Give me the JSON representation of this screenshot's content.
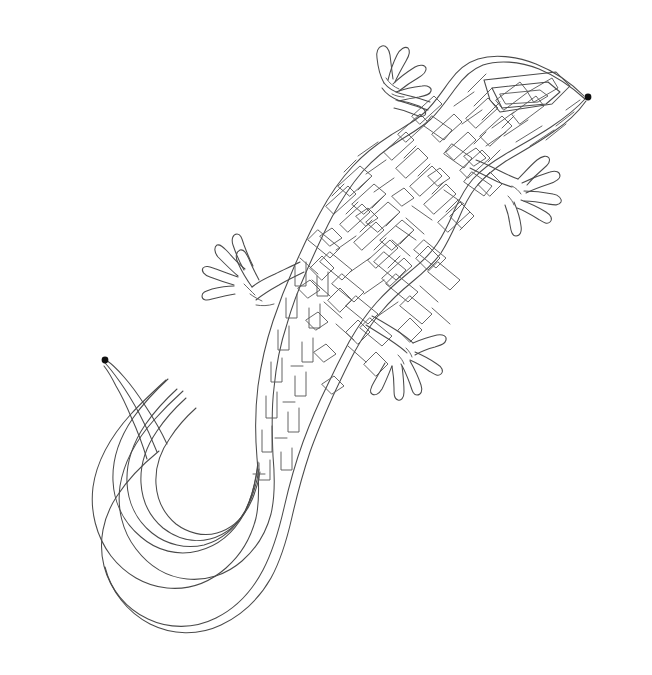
{
  "document": {
    "type": "maze-puzzle",
    "subject": "lizard",
    "title": "Lizard Maze",
    "background_color": "#ffffff",
    "line_color": "#4a4a4a",
    "marker_color": "#111111",
    "line_width": 1.05,
    "width": 652,
    "height": 675
  },
  "markers": [
    {
      "name": "start-marker",
      "label": "start",
      "x": 588,
      "y": 97,
      "radius": 3.4,
      "location": "snout tip"
    },
    {
      "name": "end-marker",
      "label": "end",
      "x": 105,
      "y": 360,
      "radius": 3.4,
      "location": "tail tip"
    }
  ],
  "body_parts": [
    {
      "name": "head",
      "label": "Head",
      "cx": 520,
      "cy": 110
    },
    {
      "name": "front-left-leg",
      "label": "Front left leg",
      "cx": 395,
      "cy": 80
    },
    {
      "name": "front-right-leg",
      "label": "Front right leg",
      "cx": 520,
      "cy": 175
    },
    {
      "name": "hind-left-leg",
      "label": "Hind left leg",
      "cx": 240,
      "cy": 270
    },
    {
      "name": "hind-right-leg",
      "label": "Hind right leg",
      "cx": 405,
      "cy": 375
    },
    {
      "name": "torso",
      "label": "Torso",
      "cx": 370,
      "cy": 220
    },
    {
      "name": "tail",
      "label": "Tail",
      "cx": 180,
      "cy": 480
    }
  ],
  "outline": {
    "name": "lizard-silhouette",
    "description": "Gecko seen from above, head to the upper right, tail curling to the lower left",
    "path": "M 585 96 C 570 86 548 73 522 66 C 498 60 476 62 462 70 C 448 78 438 90 428 101 C 418 112 407 120 396 127 C 382 135 368 142 356 152 C 340 165 328 182 318 200 C 308 218 300 236 292 254 C 284 272 278 290 272 308 C 265 330 260 352 258 374 C 256 398 257 422 260 446 C 263 470 266 492 264 512 C 262 532 254 549 241 563 C 226 579 206 588 186 589 C 164 590 144 581 128 566 C 110 549 99 525 97 500 C 95 474 103 449 118 428 C 130 411 146 397 160 383 C 117 424 101 470 110 512 C 118 548 144 573 178 577 C 208 580 235 566 250 541 C 262 520 264 496 262 472 C 259 440 252 408 250 376 C 248 346 252 317 261 289 C 270 261 283 235 298 211 C 314 186 332 163 354 146 C 374 130 397 120 416 106 C 432 94 444 79 462 70"
  },
  "corridors": {
    "description": "Dense single-solution labyrinth of nested winding walls filling the lizard silhouette",
    "spacing_px": 7,
    "tail_band_count": 6,
    "body_texture": "diagonal serpentine cells"
  },
  "toes": {
    "front_left_count": 5,
    "front_right_count": 5,
    "hind_left_count": 5,
    "hind_right_count": 5
  }
}
